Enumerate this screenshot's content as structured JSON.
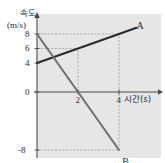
{
  "figure": {
    "background_color": "#e6e6e6",
    "page_background_color": "#ffffff",
    "axis_color": "#4a4a4a",
    "grid_color": "#9a9a9a"
  },
  "axes": {
    "y_title_line1": "속도",
    "y_title_line2": "(m/s)",
    "x_title": "시간(s)",
    "y_ticks": [
      "8",
      "6",
      "4",
      "0",
      "-8"
    ],
    "x_ticks": [
      "2",
      "4"
    ]
  },
  "chart_data": {
    "type": "line",
    "title": "",
    "xlabel": "시간(s)",
    "ylabel": "속도 (m/s)",
    "xlim": [
      0,
      5
    ],
    "ylim": [
      -10,
      10
    ],
    "xticks": [
      2,
      4
    ],
    "yticks": [
      -8,
      0,
      4,
      6,
      8
    ],
    "grid": "dashed-guides",
    "legend": "inline-endpoint-labels",
    "series": [
      {
        "name": "A",
        "color": "#2b2b2b",
        "width": 2.2,
        "x": [
          0,
          2,
          4,
          4.85
        ],
        "y": [
          4,
          6,
          8,
          8.85
        ],
        "label": "A",
        "label_x": 4.95,
        "label_y": 9.1
      },
      {
        "name": "B",
        "color": "#6e6e6e",
        "width": 2.0,
        "x": [
          0,
          2,
          4
        ],
        "y": [
          8,
          0,
          -8
        ],
        "label": "B",
        "label_x": 4.25,
        "label_y": -9.6
      }
    ],
    "guides": [
      {
        "type": "hline",
        "y": 8,
        "from_x": 0,
        "to_x": 4
      },
      {
        "type": "hline",
        "y": 6,
        "from_x": 0,
        "to_x": 2
      },
      {
        "type": "hline",
        "y": -8,
        "from_x": 0,
        "to_x": 4
      },
      {
        "type": "vline",
        "x": 2,
        "from_y": 0,
        "to_y": 6
      },
      {
        "type": "vline",
        "x": 4,
        "from_y": -8,
        "to_y": 8
      }
    ]
  }
}
